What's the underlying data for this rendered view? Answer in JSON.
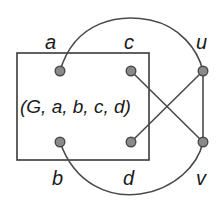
{
  "diagram": {
    "center_label": "(G, a, b, c, d)",
    "colors": {
      "stroke": "#4a4a4a",
      "node_fill": "#8a8a8a",
      "text": "#1a1a1a",
      "background": "#ffffff"
    },
    "box": {
      "x": 17,
      "y": 53,
      "width": 132,
      "height": 107
    },
    "nodes": [
      {
        "id": "a",
        "label": "a",
        "x": 60,
        "y": 71,
        "label_x": 44,
        "label_y": 48
      },
      {
        "id": "c",
        "label": "c",
        "x": 131,
        "y": 71,
        "label_x": 124,
        "label_y": 48
      },
      {
        "id": "u",
        "label": "u",
        "x": 203,
        "y": 71,
        "label_x": 196,
        "label_y": 48
      },
      {
        "id": "b",
        "label": "b",
        "x": 60,
        "y": 142,
        "label_x": 52,
        "label_y": 184
      },
      {
        "id": "d",
        "label": "d",
        "x": 131,
        "y": 142,
        "label_x": 124,
        "label_y": 184
      },
      {
        "id": "v",
        "label": "v",
        "x": 203,
        "y": 142,
        "label_x": 196,
        "label_y": 184
      }
    ],
    "edges": [
      {
        "from": "a",
        "to": "u",
        "shape": "arc-over"
      },
      {
        "from": "b",
        "to": "v",
        "shape": "arc-under"
      },
      {
        "from": "c",
        "to": "v",
        "shape": "line"
      },
      {
        "from": "d",
        "to": "u",
        "shape": "line"
      },
      {
        "from": "u",
        "to": "v",
        "shape": "line"
      }
    ]
  }
}
